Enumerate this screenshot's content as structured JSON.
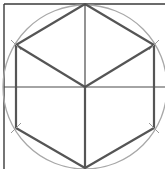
{
  "diagram": {
    "title": "",
    "colors": {
      "background": "#ffffff",
      "frame": "#3a3a3a",
      "hexagon": "#555555",
      "circle": "#a8a8a8",
      "guide": "#4a4a4a"
    },
    "circle": {
      "cx": 85,
      "cy": 87,
      "r": 82
    },
    "frame": {
      "x1": 4,
      "y1": 4,
      "x2": 165,
      "bottom": 169
    },
    "midline_y": 87,
    "hexagon_vertices": [
      [
        85,
        4
      ],
      [
        154,
        45
      ],
      [
        154,
        128
      ],
      [
        85,
        168
      ],
      [
        16,
        128
      ],
      [
        16,
        45
      ]
    ],
    "center": [
      85,
      87
    ]
  }
}
